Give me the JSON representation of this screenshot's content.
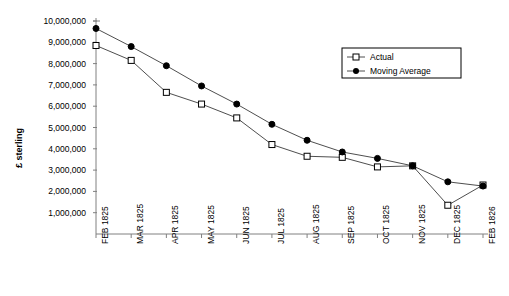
{
  "chart_data": {
    "type": "line",
    "title": "",
    "xlabel": "",
    "ylabel": "£ sterling",
    "categories": [
      "FEB 1825",
      "MAR 1825",
      "APR 1825",
      "MAY 1825",
      "JUN 1825",
      "JUL 1825",
      "AUG 1825",
      "SEP 1825",
      "OCT 1825",
      "NOV 1825",
      "DEC 1825",
      "FEB 1826"
    ],
    "ylim": [
      0,
      10000000
    ],
    "ytick_values": [
      1000000,
      2000000,
      3000000,
      4000000,
      5000000,
      6000000,
      7000000,
      8000000,
      9000000,
      10000000
    ],
    "ytick_labels": [
      "1,000,000",
      "2,000,000",
      "3,000,000",
      "4,000,000",
      "5,000,000",
      "6,000,000",
      "7,000,000",
      "8,000,000",
      "9,000,000",
      "10,000,000"
    ],
    "grid": false,
    "legend_position": "upper right",
    "series": [
      {
        "name": "Actual",
        "marker": "open-square",
        "values": [
          8850000,
          8150000,
          6650000,
          6100000,
          5450000,
          4200000,
          3650000,
          3600000,
          3150000,
          3200000,
          1350000,
          2300000
        ]
      },
      {
        "name": "Moving Average",
        "marker": "filled-circle",
        "values": [
          9650000,
          8800000,
          7900000,
          6950000,
          6100000,
          5150000,
          4400000,
          3850000,
          3550000,
          3200000,
          2450000,
          2250000
        ]
      }
    ]
  },
  "legend": {
    "entries": [
      {
        "label": "Actual"
      },
      {
        "label": "Moving Average"
      }
    ]
  }
}
